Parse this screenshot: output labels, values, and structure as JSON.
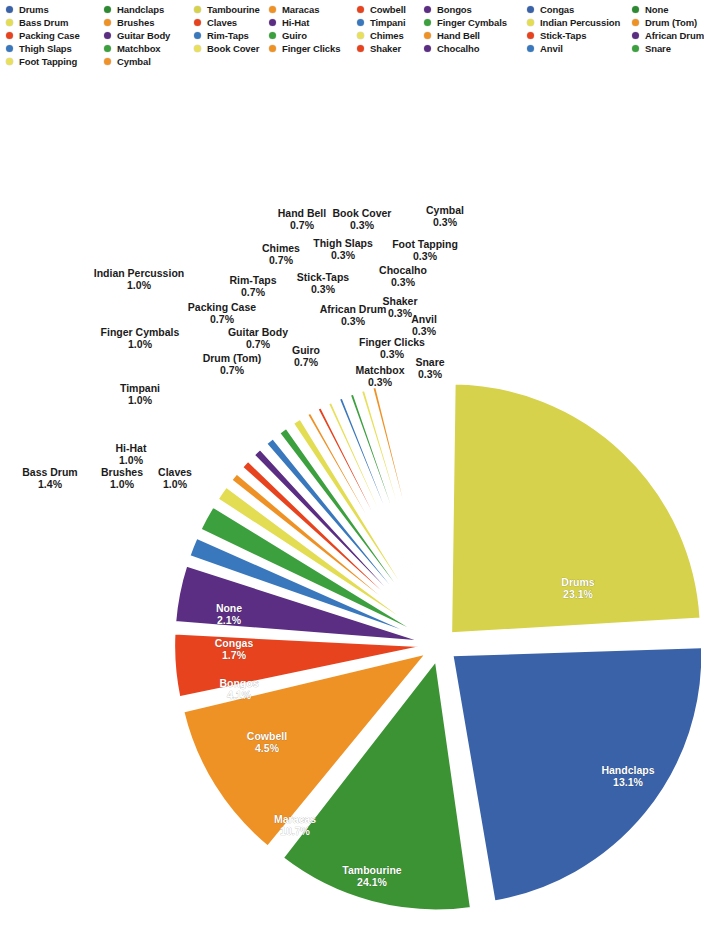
{
  "legend": {
    "columns": [
      {
        "x": 6,
        "items": [
          {
            "label": "Drums",
            "color": "#3a62a8"
          },
          {
            "label": "Bass Drum",
            "color": "#e3dd53"
          },
          {
            "label": "Packing Case",
            "color": "#e8431f"
          },
          {
            "label": "Thigh Slaps",
            "color": "#3a78bd"
          },
          {
            "label": "Foot Tapping",
            "color": "#e8e05a"
          }
        ]
      },
      {
        "x": 104,
        "items": [
          {
            "label": "Handclaps",
            "color": "#2d8a32"
          },
          {
            "label": "Brushes",
            "color": "#ef9226"
          },
          {
            "label": "Guitar Body",
            "color": "#5b2d83"
          },
          {
            "label": "Matchbox",
            "color": "#3da03f"
          },
          {
            "label": "Cymbal",
            "color": "#f0922a"
          }
        ]
      },
      {
        "x": 194,
        "items": [
          {
            "label": "Tambourine",
            "color": "#d6d24b"
          },
          {
            "label": "Claves",
            "color": "#e8431f"
          },
          {
            "label": "Rim-Taps",
            "color": "#3a78bd"
          },
          {
            "label": "Book Cover",
            "color": "#e8e05a"
          }
        ]
      },
      {
        "x": 269,
        "items": [
          {
            "label": "Maracas",
            "color": "#ef9226"
          },
          {
            "label": "Hi-Hat",
            "color": "#5b2d83"
          },
          {
            "label": "Guiro",
            "color": "#3da03f"
          },
          {
            "label": "Finger Clicks",
            "color": "#ef9226"
          }
        ]
      },
      {
        "x": 357,
        "items": [
          {
            "label": "Cowbell",
            "color": "#e8431f"
          },
          {
            "label": "Timpani",
            "color": "#3a78bd"
          },
          {
            "label": "Chimes",
            "color": "#e8e05a"
          },
          {
            "label": "Shaker",
            "color": "#e8431f"
          }
        ]
      },
      {
        "x": 424,
        "items": [
          {
            "label": "Bongos",
            "color": "#5b2d83"
          },
          {
            "label": "Finger Cymbals",
            "color": "#3da03f"
          },
          {
            "label": "Hand Bell",
            "color": "#ef9226"
          },
          {
            "label": "Chocalho",
            "color": "#5b2d83"
          }
        ]
      },
      {
        "x": 527,
        "items": [
          {
            "label": "Congas",
            "color": "#3a62a8"
          },
          {
            "label": "Indian Percussion",
            "color": "#e3dd53"
          },
          {
            "label": "Stick-Taps",
            "color": "#e8431f"
          },
          {
            "label": "Anvil",
            "color": "#3a78bd"
          }
        ]
      },
      {
        "x": 632,
        "items": [
          {
            "label": "None",
            "color": "#2d8a32"
          },
          {
            "label": "Drum (Tom)",
            "color": "#ef9226"
          },
          {
            "label": "African Drum",
            "color": "#5b2d83"
          },
          {
            "label": "Snare",
            "color": "#3da03f"
          }
        ]
      }
    ]
  },
  "chart_data": {
    "type": "pie",
    "title": "",
    "value_suffix": "%",
    "legend_position": "top",
    "exploded": true,
    "geometry": {
      "cx": 440,
      "cy": 571,
      "radius": 250,
      "explode": 16,
      "gap_deg": 1.6,
      "start_angle_deg": -90,
      "direction": "clockwise"
    },
    "categories": [
      "Tambourine",
      "Drums",
      "Handclaps",
      "Maracas",
      "Cowbell",
      "Bongos",
      "None",
      "Congas",
      "Bass Drum",
      "Brushes",
      "Claves",
      "Hi-Hat",
      "Timpani",
      "Finger Cymbals",
      "Indian Percussion",
      "Drum (Tom)",
      "Guitar Body",
      "Packing Case",
      "Rim-Taps",
      "Guiro",
      "Chimes",
      "Hand Bell",
      "Stick-Taps",
      "Thigh Slaps",
      "Book Cover",
      "African Drum",
      "Matchbox",
      "Finger Clicks",
      "Shaker",
      "Chocalho",
      "Anvil",
      "Snare",
      "Foot Tapping",
      "Cymbal"
    ],
    "values": [
      24.1,
      23.1,
      13.1,
      10.7,
      4.5,
      4.1,
      2.1,
      1.7,
      1.4,
      1.0,
      1.0,
      1.0,
      1.0,
      1.0,
      1.0,
      0.7,
      0.7,
      0.7,
      0.7,
      0.7,
      0.7,
      0.7,
      0.3,
      0.3,
      0.3,
      0.3,
      0.3,
      0.3,
      0.3,
      0.3,
      0.3,
      0.3,
      0.3,
      0.3
    ],
    "slices": [
      {
        "label": "Tambourine",
        "value": 24.1,
        "display": "24.1%",
        "color": "#d6d24b",
        "label_pos": "inside",
        "lx": 372,
        "ly": 800
      },
      {
        "label": "Drums",
        "value": 23.1,
        "display": "23.1%",
        "color": "#3a62a8",
        "label_pos": "inside",
        "lx": 578,
        "ly": 512
      },
      {
        "label": "Handclaps",
        "value": 13.1,
        "display": "13.1%",
        "color": "#3c9334",
        "label_pos": "inside",
        "lx": 628,
        "ly": 700
      },
      {
        "label": "Maracas",
        "value": 10.7,
        "display": "10.7%",
        "color": "#ef9226",
        "label_pos": "inside",
        "lx": 295,
        "ly": 749
      },
      {
        "label": "Cowbell",
        "value": 4.5,
        "display": "4.5%",
        "color": "#e8431f",
        "label_pos": "inside",
        "lx": 267,
        "ly": 666
      },
      {
        "label": "Bongos",
        "value": 4.1,
        "display": "4.1%",
        "color": "#5b2d83",
        "label_pos": "inside",
        "lx": 239,
        "ly": 613
      },
      {
        "label": "Congas",
        "value": 1.7,
        "display": "1.7%",
        "color": "#3a78bd",
        "label_pos": "inside",
        "lx": 234,
        "ly": 573
      },
      {
        "label": "None",
        "value": 2.1,
        "display": "2.1%",
        "color": "#3da03f",
        "label_pos": "inside",
        "lx": 229,
        "ly": 538
      },
      {
        "label": "Bass Drum",
        "value": 1.4,
        "display": "1.4%",
        "color": "#e3dd53",
        "label_pos": "outside",
        "lx": 50,
        "ly": 402
      },
      {
        "label": "Brushes",
        "value": 1.0,
        "display": "1.0%",
        "color": "#ef9226",
        "label_pos": "outside",
        "lx": 122,
        "ly": 402
      },
      {
        "label": "Claves",
        "value": 1.0,
        "display": "1.0%",
        "color": "#e8431f",
        "label_pos": "outside",
        "lx": 175,
        "ly": 402
      },
      {
        "label": "Hi-Hat",
        "value": 1.0,
        "display": "1.0%",
        "color": "#5b2d83",
        "label_pos": "outside",
        "lx": 131,
        "ly": 378
      },
      {
        "label": "Timpani",
        "value": 1.0,
        "display": "1.0%",
        "color": "#3a78bd",
        "label_pos": "outside",
        "lx": 140,
        "ly": 318
      },
      {
        "label": "Finger Cymbals",
        "value": 1.0,
        "display": "1.0%",
        "color": "#3da03f",
        "label_pos": "outside",
        "lx": 140,
        "ly": 262
      },
      {
        "label": "Indian Percussion",
        "value": 1.0,
        "display": "1.0%",
        "color": "#e3dd53",
        "label_pos": "outside",
        "lx": 139,
        "ly": 203
      },
      {
        "label": "Drum (Tom)",
        "value": 0.7,
        "display": "0.7%",
        "color": "#ef9226",
        "label_pos": "outside",
        "lx": 232,
        "ly": 288
      },
      {
        "label": "Guitar Body",
        "value": 0.7,
        "display": "0.7%",
        "color": "#e8431f",
        "label_pos": "outside",
        "lx": 258,
        "ly": 262
      },
      {
        "label": "Packing Case",
        "value": 0.7,
        "display": "0.7%",
        "color": "#e8e05a",
        "label_pos": "outside",
        "lx": 222,
        "ly": 237
      },
      {
        "label": "Rim-Taps",
        "value": 0.7,
        "display": "0.7%",
        "color": "#3a78bd",
        "label_pos": "outside",
        "lx": 253,
        "ly": 210
      },
      {
        "label": "Guiro",
        "value": 0.7,
        "display": "0.7%",
        "color": "#3da03f",
        "label_pos": "outside",
        "lx": 306,
        "ly": 280
      },
      {
        "label": "Chimes",
        "value": 0.7,
        "display": "0.7%",
        "color": "#e8e05a",
        "label_pos": "outside",
        "lx": 281,
        "ly": 178
      },
      {
        "label": "Hand Bell",
        "value": 0.7,
        "display": "0.7%",
        "color": "#ef9226",
        "label_pos": "outside",
        "lx": 302,
        "ly": 143
      },
      {
        "label": "Stick-Taps",
        "value": 0.3,
        "display": "0.3%",
        "color": "#e8431f",
        "label_pos": "outside",
        "lx": 323,
        "ly": 207
      },
      {
        "label": "Thigh Slaps",
        "value": 0.3,
        "display": "0.3%",
        "color": "#3a78bd",
        "label_pos": "outside",
        "lx": 343,
        "ly": 173
      },
      {
        "label": "Book Cover",
        "value": 0.3,
        "display": "0.3%",
        "color": "#e8e05a",
        "label_pos": "outside",
        "lx": 362,
        "ly": 143
      },
      {
        "label": "African Drum",
        "value": 0.3,
        "display": "0.3%",
        "color": "#5b2d83",
        "label_pos": "outside",
        "lx": 353,
        "ly": 239
      },
      {
        "label": "Matchbox",
        "value": 0.3,
        "display": "0.3%",
        "color": "#3da03f",
        "label_pos": "outside",
        "lx": 380,
        "ly": 300
      },
      {
        "label": "Finger Clicks",
        "value": 0.3,
        "display": "0.3%",
        "color": "#ef9226",
        "label_pos": "outside",
        "lx": 392,
        "ly": 272
      },
      {
        "label": "Shaker",
        "value": 0.3,
        "display": "0.3%",
        "color": "#e8431f",
        "label_pos": "outside",
        "lx": 400,
        "ly": 231
      },
      {
        "label": "Chocalho",
        "value": 0.3,
        "display": "0.3%",
        "color": "#5b2d83",
        "label_pos": "outside",
        "lx": 403,
        "ly": 200
      },
      {
        "label": "Anvil",
        "value": 0.3,
        "display": "0.3%",
        "color": "#3a78bd",
        "label_pos": "outside",
        "lx": 424,
        "ly": 249
      },
      {
        "label": "Snare",
        "value": 0.3,
        "display": "0.3%",
        "color": "#3da03f",
        "label_pos": "outside",
        "lx": 430,
        "ly": 292
      },
      {
        "label": "Foot Tapping",
        "value": 0.3,
        "display": "0.3%",
        "color": "#e8e05a",
        "label_pos": "outside",
        "lx": 425,
        "ly": 174
      },
      {
        "label": "Cymbal",
        "value": 0.3,
        "display": "0.3%",
        "color": "#ef9226",
        "label_pos": "outside",
        "lx": 445,
        "ly": 140
      }
    ]
  }
}
